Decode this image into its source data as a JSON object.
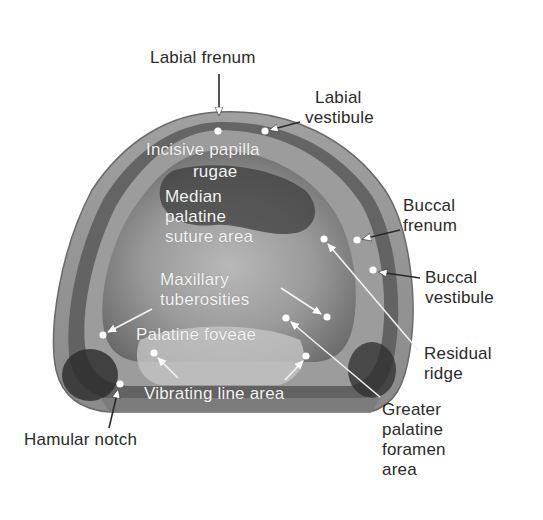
{
  "figure": {
    "colors": {
      "background": "#ffffff",
      "cast_outer": "#8c8c8c",
      "cast_mid": "#a9a9a9",
      "cast_dark": "#3a3a3a",
      "cast_light": "#c6c6c6",
      "outer_label_text": "#2a2a2a",
      "inner_label_text": "#f4f4f4",
      "marker": "#ffffff"
    }
  },
  "labels": {
    "labial_frenum": {
      "lines": [
        "Labial frenum"
      ]
    },
    "labial_vestibule": {
      "lines": [
        "Labial",
        "vestibule"
      ]
    },
    "incisive_papilla": {
      "lines": [
        "Incisive papilla"
      ]
    },
    "rugae": {
      "lines": [
        "rugae"
      ]
    },
    "median_palatine_suture": {
      "lines": [
        "Median",
        "palatine",
        "suture area"
      ]
    },
    "buccal_frenum": {
      "lines": [
        "Buccal",
        "frenum"
      ]
    },
    "buccal_vestibule": {
      "lines": [
        "Buccal",
        "vestibule"
      ]
    },
    "maxillary_tuberosities": {
      "lines": [
        "Maxillary",
        "tuberosities"
      ]
    },
    "palatine_foveae": {
      "lines": [
        "Palatine foveae"
      ]
    },
    "residual_ridge": {
      "lines": [
        "Residual",
        "ridge"
      ]
    },
    "vibrating_line_area": {
      "lines": [
        "Vibrating line area"
      ]
    },
    "greater_palatine_foramen": {
      "lines": [
        "Greater",
        "palatine",
        "foramen",
        "area"
      ]
    },
    "hamular_notch": {
      "lines": [
        "Hamular notch"
      ]
    }
  }
}
